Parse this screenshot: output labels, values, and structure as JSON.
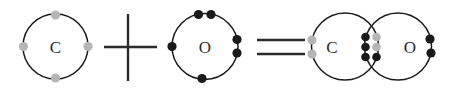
{
  "diagram": {
    "canvas": {
      "width": 460,
      "height": 92,
      "background": "#ffffff"
    },
    "colors": {
      "shell_stroke": "#1a1a1a",
      "label_text": "#2b2b2b",
      "carbon_electron": "#b5b5b5",
      "oxygen_electron": "#1a1a1a",
      "operator": "#2b2b2b"
    },
    "operators": [
      {
        "id": "plus",
        "symbol": "+",
        "name": "plus-sign",
        "horizontal": {
          "x1": 104,
          "y1": 47,
          "x2": 157,
          "y2": 47
        },
        "vertical": {
          "x1": 128,
          "y1": 14,
          "x2": 128,
          "y2": 81
        }
      },
      {
        "id": "equals",
        "symbol": "=",
        "name": "equals-sign",
        "line_top": {
          "x1": 257,
          "y1": 40,
          "x2": 305,
          "y2": 40
        },
        "line_bottom": {
          "x1": 257,
          "y1": 54,
          "x2": 305,
          "y2": 54
        }
      }
    ],
    "reactants": [
      {
        "id": "carbon-reactant",
        "element": "C",
        "name": "Carbon",
        "valence_electrons": 4,
        "electron_color": "#b5b5b5",
        "circle": {
          "cx": 55.5,
          "cy": 46.5,
          "r": 32.5
        },
        "label": {
          "x": 55.5,
          "y": 47
        },
        "electrons": [
          {
            "cx": 55.5,
            "cy": 15,
            "r": 4.6,
            "position": "top"
          },
          {
            "cx": 55.5,
            "cy": 78,
            "r": 4.6,
            "position": "bottom"
          },
          {
            "cx": 23.5,
            "cy": 46.5,
            "r": 4.6,
            "position": "left"
          },
          {
            "cx": 88,
            "cy": 46.5,
            "r": 4.6,
            "position": "right"
          }
        ]
      },
      {
        "id": "oxygen-reactant",
        "element": "O",
        "name": "Oxygen",
        "valence_electrons": 6,
        "electron_color": "#1a1a1a",
        "circle": {
          "cx": 205,
          "cy": 46.5,
          "r": 33
        },
        "label": {
          "x": 205,
          "y": 47
        },
        "electrons": [
          {
            "cx": 198.5,
            "cy": 14.5,
            "r": 4.6,
            "position": "top-left"
          },
          {
            "cx": 211,
            "cy": 14.5,
            "r": 4.6,
            "position": "top-right"
          },
          {
            "cx": 172,
            "cy": 46.5,
            "r": 4.6,
            "position": "left"
          },
          {
            "cx": 237,
            "cy": 39.5,
            "r": 4.6,
            "position": "right-upper"
          },
          {
            "cx": 237,
            "cy": 53,
            "r": 4.6,
            "position": "right-lower"
          },
          {
            "cx": 202,
            "cy": 78.5,
            "r": 4.6,
            "position": "bottom"
          }
        ]
      }
    ],
    "product": {
      "id": "carbon-monoxide",
      "name": "Carbon monoxide",
      "formula": "CO",
      "bond_type": "triple",
      "shared_electrons": 6,
      "atoms": [
        {
          "id": "carbon-product",
          "element": "C",
          "name": "Carbon",
          "circle": {
            "cx": 345,
            "cy": 46.5,
            "r": 33.5
          },
          "label": {
            "x": 332,
            "y": 47
          },
          "electron_color": "#b5b5b5",
          "lone_electrons": [
            {
              "cx": 312,
              "cy": 40,
              "r": 4.6,
              "position": "left-upper"
            },
            {
              "cx": 312,
              "cy": 54,
              "r": 4.6,
              "position": "left-lower"
            }
          ]
        },
        {
          "id": "oxygen-product",
          "element": "O",
          "name": "Oxygen",
          "circle": {
            "cx": 398,
            "cy": 46.5,
            "r": 33.5
          },
          "label": {
            "x": 410,
            "y": 47
          },
          "electron_color": "#1a1a1a",
          "lone_electrons": [
            {
              "cx": 430,
              "cy": 39,
              "r": 4.6,
              "position": "right-upper"
            },
            {
              "cx": 431,
              "cy": 53,
              "r": 4.6,
              "position": "right-lower"
            }
          ]
        }
      ],
      "bonding_electrons": [
        {
          "cx": 365.5,
          "cy": 37,
          "r": 4.3,
          "color": "#1a1a1a",
          "origin": "oxygen",
          "position": "row1-left"
        },
        {
          "cx": 376.5,
          "cy": 37,
          "r": 4.3,
          "color": "#b5b5b5",
          "origin": "carbon",
          "position": "row1-right"
        },
        {
          "cx": 365.5,
          "cy": 47,
          "r": 4.3,
          "color": "#1a1a1a",
          "origin": "oxygen",
          "position": "row2-left"
        },
        {
          "cx": 376.5,
          "cy": 47,
          "r": 4.3,
          "color": "#b5b5b5",
          "origin": "carbon",
          "position": "row2-right"
        },
        {
          "cx": 365.5,
          "cy": 57,
          "r": 4.3,
          "color": "#1a1a1a",
          "origin": "oxygen",
          "position": "row3-left"
        },
        {
          "cx": 376.5,
          "cy": 57,
          "r": 4.3,
          "color": "#1a1a1a",
          "origin": "carbon",
          "position": "row3-right"
        }
      ]
    }
  }
}
